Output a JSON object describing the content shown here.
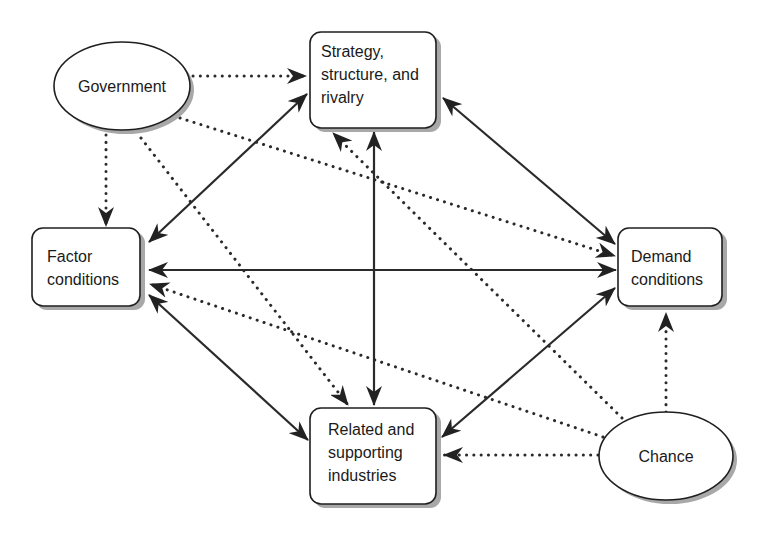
{
  "diagram": {
    "nodes": {
      "government": {
        "label": "Government",
        "shape": "ellipse"
      },
      "strategy": {
        "lines": [
          "Strategy,",
          "structure, and",
          "rivalry"
        ],
        "shape": "box"
      },
      "factor": {
        "lines": [
          "Factor",
          "conditions"
        ],
        "shape": "box"
      },
      "demand": {
        "lines": [
          "Demand",
          "conditions"
        ],
        "shape": "box"
      },
      "related": {
        "lines": [
          "Related and",
          "supporting",
          "industries"
        ],
        "shape": "box"
      },
      "chance": {
        "label": "Chance",
        "shape": "ellipse"
      }
    },
    "edges": [
      {
        "from": "strategy",
        "to": "factor",
        "style": "solid",
        "direction": "both"
      },
      {
        "from": "strategy",
        "to": "demand",
        "style": "solid",
        "direction": "both"
      },
      {
        "from": "strategy",
        "to": "related",
        "style": "solid",
        "direction": "both"
      },
      {
        "from": "factor",
        "to": "demand",
        "style": "solid",
        "direction": "both"
      },
      {
        "from": "factor",
        "to": "related",
        "style": "solid",
        "direction": "both"
      },
      {
        "from": "demand",
        "to": "related",
        "style": "solid",
        "direction": "both"
      },
      {
        "from": "government",
        "to": "strategy",
        "style": "dotted",
        "direction": "forward"
      },
      {
        "from": "government",
        "to": "factor",
        "style": "dotted",
        "direction": "forward"
      },
      {
        "from": "government",
        "to": "demand",
        "style": "dotted",
        "direction": "forward"
      },
      {
        "from": "government",
        "to": "related",
        "style": "dotted",
        "direction": "forward"
      },
      {
        "from": "chance",
        "to": "strategy",
        "style": "dotted",
        "direction": "forward"
      },
      {
        "from": "chance",
        "to": "factor",
        "style": "dotted",
        "direction": "forward"
      },
      {
        "from": "chance",
        "to": "demand",
        "style": "dotted",
        "direction": "forward"
      },
      {
        "from": "chance",
        "to": "related",
        "style": "dotted",
        "direction": "forward"
      }
    ],
    "colors": {
      "stroke": "#2a2a2a",
      "shadow": "#a8a8a8",
      "background": "#ffffff"
    }
  }
}
